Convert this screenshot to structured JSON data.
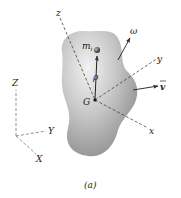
{
  "figure": {
    "caption": "(a)",
    "body_labels": {
      "z": "z",
      "y": "y",
      "x": "x",
      "G": "G",
      "mi": "m",
      "mi_sub": "i",
      "rho": "ρ",
      "omega": "ω",
      "v": "v"
    },
    "global_axes": {
      "Z": "Z",
      "Y": "Y",
      "X": "X"
    }
  }
}
